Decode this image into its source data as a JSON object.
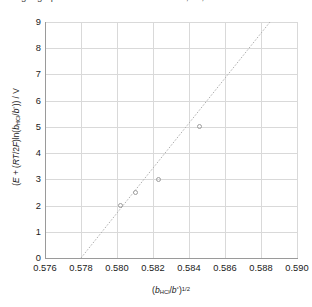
{
  "top_caption": "Fitting a graph to estimate the standard emf, E°, of a cell",
  "chart_data": {
    "type": "scatter",
    "title": "",
    "xlabel": "(b_HCl/b°)^(1/2)",
    "ylabel": "(E + (RT/2F)ln(b_HCl/b°)) / V",
    "xlim": [
      0.576,
      0.59
    ],
    "ylim": [
      0,
      9
    ],
    "xticks": [
      "0.576",
      "0.578",
      "0.580",
      "0.582",
      "0.584",
      "0.586",
      "0.588",
      "0.590"
    ],
    "xtick_values": [
      0.576,
      0.578,
      0.58,
      0.582,
      0.584,
      0.586,
      0.588,
      0.59
    ],
    "yticks": [
      "0",
      "1",
      "2",
      "3",
      "4",
      "5",
      "6",
      "7",
      "8",
      "9"
    ],
    "ytick_values": [
      0,
      1,
      2,
      3,
      4,
      5,
      6,
      7,
      8,
      9
    ],
    "grid": true,
    "legend": false,
    "series": [
      {
        "name": "data points",
        "marker": "open-circle",
        "color": "#9d9d9d",
        "points": [
          {
            "x": 0.5802,
            "y": 2.0
          },
          {
            "x": 0.581,
            "y": 2.5
          },
          {
            "x": 0.5823,
            "y": 3.0
          },
          {
            "x": 0.5846,
            "y": 5.0
          }
        ]
      },
      {
        "name": "linear trendline",
        "style": "dotted",
        "color": "#b0b0b0",
        "endpoints": [
          {
            "x": 0.578,
            "y": 0.0
          },
          {
            "x": 0.5885,
            "y": 9.0
          }
        ],
        "slope": 857.1,
        "intercept": -495.4
      }
    ]
  },
  "axis_titles": {
    "y_prefix": "(",
    "y_E": "E",
    "y_plus": " + (",
    "y_RT": "RT",
    "y_over2F": "/2",
    "y_F": "F",
    "y_close1": ")ln(",
    "y_b": "b",
    "y_sub_HCl": "HCl",
    "y_slash": "/",
    "y_b2": "b",
    "y_deg": "°",
    "y_close2": ")) / V",
    "x_open": "(",
    "x_b": "b",
    "x_sub_HCl": "HCl",
    "x_slash": "/",
    "x_b2": "b",
    "x_deg": "°",
    "x_close": ")",
    "x_exp": "1/2"
  }
}
